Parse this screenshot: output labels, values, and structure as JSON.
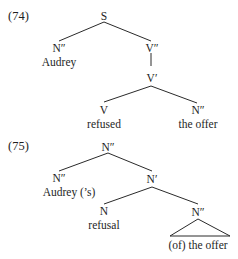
{
  "examples": [
    {
      "number": "(74)",
      "nodes": {
        "root": "S",
        "subject_cat": "N″",
        "subject_word": "Audrey",
        "vp_max": "V″",
        "vp_bar": "V′",
        "verb_cat": "V",
        "verb_word": "refused",
        "object_cat": "N″",
        "object_word": "the offer"
      }
    },
    {
      "number": "(75)",
      "nodes": {
        "root": "N″",
        "spec_cat": "N″",
        "spec_word": "Audrey  (’s)",
        "nbar": "N′",
        "head_cat": "N",
        "head_word": "refusal",
        "comp_cat": "N″",
        "comp_word": "(of) the offer"
      }
    }
  ]
}
